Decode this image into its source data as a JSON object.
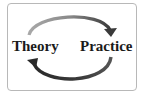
{
  "diagram": {
    "type": "cycle",
    "nodes": [
      {
        "id": "theory",
        "label": "Theory"
      },
      {
        "id": "practice",
        "label": "Practice"
      }
    ],
    "edges": [
      {
        "from": "theory",
        "to": "practice",
        "position": "top"
      },
      {
        "from": "practice",
        "to": "theory",
        "position": "bottom"
      }
    ]
  },
  "colors": {
    "frame_border": "#b8b8b8",
    "background": "#ffffff",
    "text": "#1a1a1a",
    "arrow_light": "#9a9a9a",
    "arrow_dark": "#3a3a3a"
  }
}
